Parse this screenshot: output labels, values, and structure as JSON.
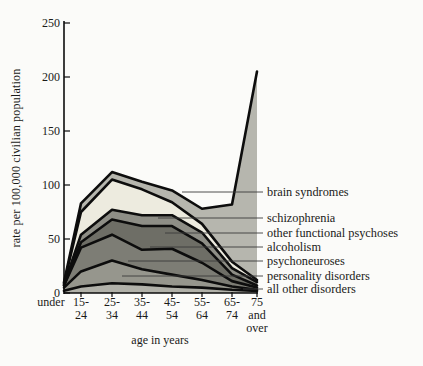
{
  "figure": {
    "background": "#fbfbf9",
    "text_color": "#1a1a18",
    "line_color": "#0d0d0d"
  },
  "chart_data": {
    "type": "area",
    "stacked": true,
    "title": "",
    "xlabel": "age in years",
    "ylabel": "rate per 100,000 civilian population",
    "ylim": [
      0,
      250
    ],
    "yticks": [
      0,
      50,
      100,
      150,
      200,
      250
    ],
    "grid": false,
    "legend_position": "right",
    "categories": [
      "under",
      "15-24",
      "25-34",
      "35-44",
      "45-54",
      "55-64",
      "65-74",
      "75 and over"
    ],
    "category_label_lines": [
      [
        "under"
      ],
      [
        "15-",
        "24"
      ],
      [
        "25-",
        "34"
      ],
      [
        "35-",
        "44"
      ],
      [
        "45-",
        "54"
      ],
      [
        "55-",
        "64"
      ],
      [
        "65-",
        "74"
      ],
      [
        "75",
        "and",
        "over"
      ]
    ],
    "series": [
      {
        "name": "all other disorders",
        "color": "#b1b1a9",
        "values": [
          2,
          6,
          9,
          8,
          6,
          5,
          3,
          2
        ]
      },
      {
        "name": "personality disorders",
        "color": "#96968d",
        "values": [
          3,
          14,
          21,
          14,
          11,
          7,
          3,
          1
        ]
      },
      {
        "name": "psychoneuroses",
        "color": "#7d7d75",
        "values": [
          2,
          22,
          24,
          18,
          24,
          16,
          5,
          2
        ]
      },
      {
        "name": "alcoholism",
        "color": "#6e6e66",
        "values": [
          0,
          5,
          14,
          22,
          21,
          18,
          6,
          2
        ]
      },
      {
        "name": "other functional psychoses",
        "color": "#8e8e86",
        "values": [
          1,
          7,
          9,
          10,
          10,
          10,
          6,
          3
        ]
      },
      {
        "name": "schizophrenia",
        "color": "#edebdf",
        "values": [
          1,
          21,
          28,
          24,
          12,
          8,
          6,
          2
        ]
      },
      {
        "name": "brain syndromes",
        "color": "#b6b6ae",
        "values": [
          1,
          8,
          7,
          7,
          11,
          14,
          53,
          193
        ]
      }
    ],
    "totals": [
      10,
      83,
      112,
      103,
      95,
      78,
      82,
      205
    ]
  }
}
